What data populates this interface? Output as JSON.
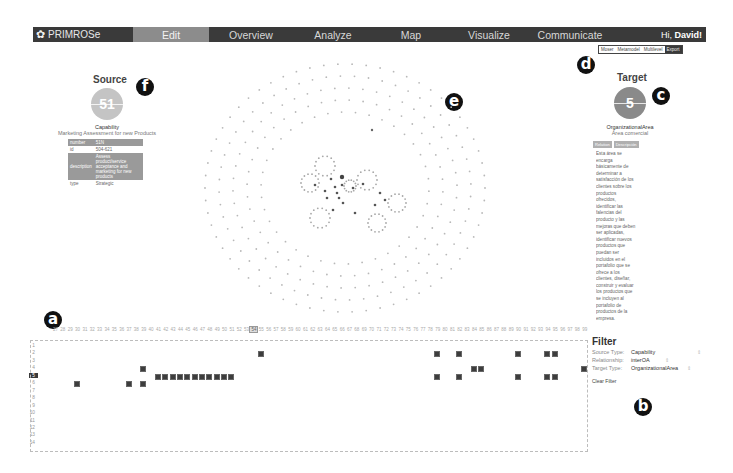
{
  "navbar": {
    "brand": "PRIMROSe",
    "items": [
      {
        "label": "Edit",
        "active": true,
        "width": 76
      },
      {
        "label": "Overview",
        "active": false,
        "width": 84
      },
      {
        "label": "Analyze",
        "active": false,
        "width": 80
      },
      {
        "label": "Map",
        "active": false,
        "width": 76
      },
      {
        "label": "Visualize",
        "active": false,
        "width": 80
      },
      {
        "label": "Communicate",
        "active": false,
        "width": 82
      }
    ],
    "greeting_prefix": "Hi, ",
    "greeting_name": "David!"
  },
  "view_switch": {
    "options": [
      "Moser",
      "Metamodel",
      "Multilevel"
    ],
    "export_label": "Export"
  },
  "callouts": {
    "a": "a",
    "b": "b",
    "c": "c",
    "d": "d",
    "e": "e",
    "f": "f"
  },
  "source": {
    "title": "Source",
    "badge": "51",
    "color": "#c4c4c4",
    "type": "Capability",
    "name": "Marketing Assessment for new Products",
    "properties": [
      {
        "key": "number",
        "value": "51N",
        "style": "shaded"
      },
      {
        "key": "id",
        "value": "504-621",
        "style": "plain"
      },
      {
        "key": "description",
        "value": "Assess product/service acceptance and marketing for new products",
        "style": "shaded"
      },
      {
        "key": "type",
        "value": "Strategic",
        "style": "plain"
      }
    ]
  },
  "target": {
    "title": "Target",
    "badge": "5",
    "color": "#8a8a8a",
    "type": "OrganizationalArea",
    "name": "Área comercial",
    "header_cells": [
      "Relation",
      "Descripción"
    ],
    "description": "Esta área se encarga básicamente de determinar a satisfacción de los clientes sobre los productos ofrecidos, identificar las falencias del producto y las mejoras que deben ser aplicadas, identificar nuevos productos que puedan ser incluidos en el portafolio que se ofrece a los clientes, diseñar, construir y evaluar los productos que se incluyen al portafolio de productos de la empresa."
  },
  "matrix": {
    "row_labels": [
      "1",
      "2",
      "3",
      "4",
      "5",
      "6",
      "7",
      "8",
      "9",
      "10",
      "11",
      "12",
      "13",
      "14"
    ],
    "highlight_row": "5",
    "col_start": 27,
    "col_end": 99,
    "highlight_col": 54,
    "cells": [
      {
        "row": 2,
        "col": 55
      },
      {
        "row": 2,
        "col": 79
      },
      {
        "row": 2,
        "col": 82
      },
      {
        "row": 2,
        "col": 90
      },
      {
        "row": 2,
        "col": 94
      },
      {
        "row": 2,
        "col": 95
      },
      {
        "row": 4,
        "col": 39
      },
      {
        "row": 4,
        "col": 84
      },
      {
        "row": 4,
        "col": 85
      },
      {
        "row": 4,
        "col": 99
      },
      {
        "row": 5,
        "col": 41
      },
      {
        "row": 5,
        "col": 42
      },
      {
        "row": 5,
        "col": 43
      },
      {
        "row": 5,
        "col": 44
      },
      {
        "row": 5,
        "col": 45
      },
      {
        "row": 5,
        "col": 46
      },
      {
        "row": 5,
        "col": 47
      },
      {
        "row": 5,
        "col": 48
      },
      {
        "row": 5,
        "col": 49
      },
      {
        "row": 5,
        "col": 50
      },
      {
        "row": 5,
        "col": 51
      },
      {
        "row": 5,
        "col": 79
      },
      {
        "row": 5,
        "col": 82
      },
      {
        "row": 5,
        "col": 90
      },
      {
        "row": 5,
        "col": 94
      },
      {
        "row": 5,
        "col": 95
      },
      {
        "row": 6,
        "col": 30
      },
      {
        "row": 6,
        "col": 37
      },
      {
        "row": 6,
        "col": 39
      }
    ]
  },
  "filter": {
    "title": "Filter",
    "rows": [
      {
        "label": "Source Type:",
        "value": "Capability"
      },
      {
        "label": "Relationship:",
        "value": "interOA"
      },
      {
        "label": "Target Type:",
        "value": "OrganizationalArea"
      }
    ],
    "clear_label": "Clear Filter"
  }
}
